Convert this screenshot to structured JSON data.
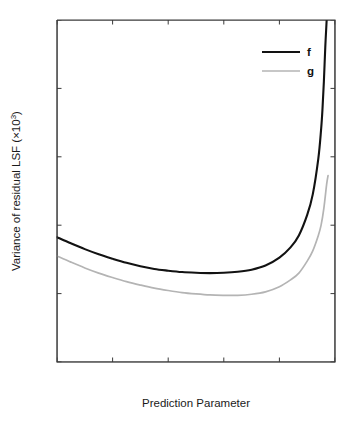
{
  "chart_data": {
    "type": "line",
    "title": "",
    "subtitle": "",
    "xlabel": "Prediction Parameter",
    "ylabel": "Variance of residual LSF (×10³)",
    "ylabel_base": "Variance of residual LSF (×10",
    "ylabel_exp": "3",
    "ylabel_close": ")",
    "xlim": [
      0,
      1
    ],
    "ylim": [
      2,
      12
    ],
    "grid": false,
    "legend_position": "top-right",
    "xticks": [
      0,
      0.2,
      0.4,
      0.6,
      0.8,
      1
    ],
    "xticklabels": [
      "0",
      "0.2",
      "0.4",
      "0.6",
      "0.8",
      "1"
    ],
    "yticks": [
      2,
      4,
      6,
      8,
      10,
      12
    ],
    "yticklabels": [
      "2",
      "4",
      "6",
      "8",
      "10",
      "12"
    ],
    "series": [
      {
        "name": "f",
        "color": "#121212",
        "width": 2.1,
        "x": [
          0.0,
          0.05,
          0.1,
          0.15,
          0.2,
          0.25,
          0.3,
          0.35,
          0.4,
          0.45,
          0.5,
          0.55,
          0.6,
          0.65,
          0.7,
          0.75,
          0.8,
          0.84,
          0.87,
          0.9,
          0.92,
          0.94,
          0.95,
          0.955,
          0.96,
          0.965,
          0.97
        ],
        "y": [
          5.65,
          5.47,
          5.3,
          5.15,
          5.02,
          4.9,
          4.8,
          4.72,
          4.67,
          4.63,
          4.61,
          4.6,
          4.61,
          4.64,
          4.7,
          4.82,
          5.05,
          5.35,
          5.7,
          6.3,
          6.9,
          7.95,
          8.8,
          9.4,
          10.2,
          11.2,
          12.0
        ]
      },
      {
        "name": "g",
        "color": "#b4b4b4",
        "width": 1.7,
        "x": [
          0.0,
          0.05,
          0.1,
          0.15,
          0.2,
          0.25,
          0.3,
          0.35,
          0.4,
          0.45,
          0.5,
          0.55,
          0.6,
          0.65,
          0.7,
          0.75,
          0.8,
          0.84,
          0.87,
          0.9,
          0.92,
          0.94,
          0.95,
          0.96,
          0.97,
          0.975
        ],
        "y": [
          5.1,
          4.92,
          4.75,
          4.6,
          4.47,
          4.35,
          4.25,
          4.16,
          4.09,
          4.03,
          3.99,
          3.96,
          3.95,
          3.95,
          3.98,
          4.05,
          4.2,
          4.4,
          4.6,
          4.95,
          5.25,
          5.7,
          6.0,
          6.5,
          7.2,
          7.45
        ]
      }
    ],
    "legend": [
      {
        "label": "f",
        "color": "#121212"
      },
      {
        "label": "g",
        "color": "#b4b4b4"
      }
    ],
    "annotations": []
  },
  "figure": {
    "background": "#ffffff",
    "axis_color": "#3a3a3a",
    "text_color": "#1a1a1a"
  }
}
